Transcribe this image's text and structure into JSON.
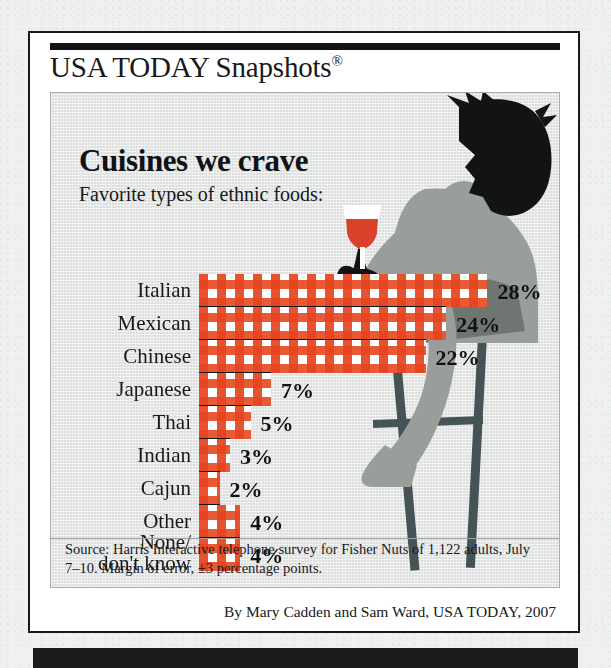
{
  "brand": {
    "name": "USA TODAY Snapshots",
    "registered_mark": "®"
  },
  "headline": "Cuisines we crave",
  "subhead": "Favorite types of ethnic foods:",
  "source": "Source:  Harris Interactive telephone survey for Fisher Nuts of 1,122 adults, July 7–10. Margin of error, ±3 percentage points.",
  "byline": "By Mary Cadden and Sam Ward, USA TODAY, 2007",
  "illustration": {
    "name": "man-on-barstool-holding-wine-glass",
    "silhouette_color": "#111314",
    "body_color": "#9a9e9b",
    "body_shade_color": "#6f7571",
    "stool_color": "#465356",
    "wine_color": "#d9412a",
    "glass_color": "#ffffff"
  },
  "colors": {
    "gingham_red": "#e74b24",
    "gingham_light": "#f2966e",
    "panel_bg": "#dcdfde",
    "card_bg": "#ffffff",
    "ink": "#17191a",
    "page_bg": "#eef1f0"
  },
  "chart_data": {
    "type": "bar",
    "title": "Cuisines we crave",
    "subtitle": "Favorite types of ethnic foods:",
    "orientation": "horizontal",
    "xlabel": "",
    "ylabel": "",
    "xlim": [
      0,
      28
    ],
    "grid": false,
    "legend": null,
    "unit": "%",
    "categories": [
      "Italian",
      "Mexican",
      "Chinese",
      "Japanese",
      "Thai",
      "Indian",
      "Cajun",
      "Other",
      "None/\ndon't know"
    ],
    "values": [
      28,
      24,
      22,
      7,
      5,
      3,
      2,
      4,
      4
    ],
    "value_labels": [
      "28%",
      "24%",
      "22%",
      "7%",
      "5%",
      "3%",
      "2%",
      "4%",
      "4%"
    ]
  }
}
